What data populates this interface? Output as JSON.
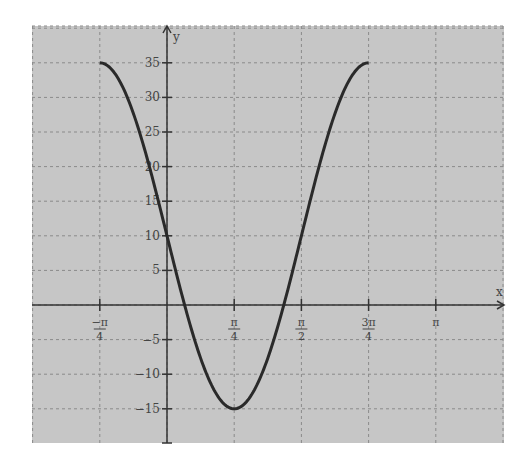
{
  "chart_data": {
    "type": "line",
    "title": "",
    "xlabel": "x",
    "ylabel": "y",
    "function": "y = 10 - 25 sin(2x)",
    "x_range": [
      -1.5708,
      3.5343
    ],
    "ylim": [
      -20,
      40
    ],
    "grid": true,
    "x_ticks": [
      {
        "value": -0.7854,
        "num": "−π",
        "den": "4"
      },
      {
        "value": 0.7854,
        "num": "π",
        "den": "4"
      },
      {
        "value": 1.5708,
        "num": "π",
        "den": "2"
      },
      {
        "value": 2.3562,
        "num": "3π",
        "den": "4"
      },
      {
        "value": 3.1416,
        "num": "π",
        "den": ""
      }
    ],
    "y_ticks": [
      35,
      30,
      25,
      20,
      15,
      10,
      5,
      -5,
      -10,
      -15
    ],
    "series": [
      {
        "name": "curve",
        "domain": [
          -0.7854,
          2.3562
        ],
        "points": [
          {
            "x": -0.7854,
            "y": 35
          },
          {
            "x": -0.3927,
            "y": 27.68
          },
          {
            "x": 0,
            "y": 10
          },
          {
            "x": 0.3927,
            "y": -7.68
          },
          {
            "x": 0.7854,
            "y": -15
          },
          {
            "x": 1.1781,
            "y": -7.68
          },
          {
            "x": 1.5708,
            "y": 10
          },
          {
            "x": 1.9635,
            "y": 27.68
          },
          {
            "x": 2.3562,
            "y": 35
          }
        ]
      }
    ]
  },
  "colors": {
    "background": "#c8c8c8",
    "grid": "#8a8a8a",
    "axis": "#333333",
    "curve": "#2a2a2a"
  }
}
